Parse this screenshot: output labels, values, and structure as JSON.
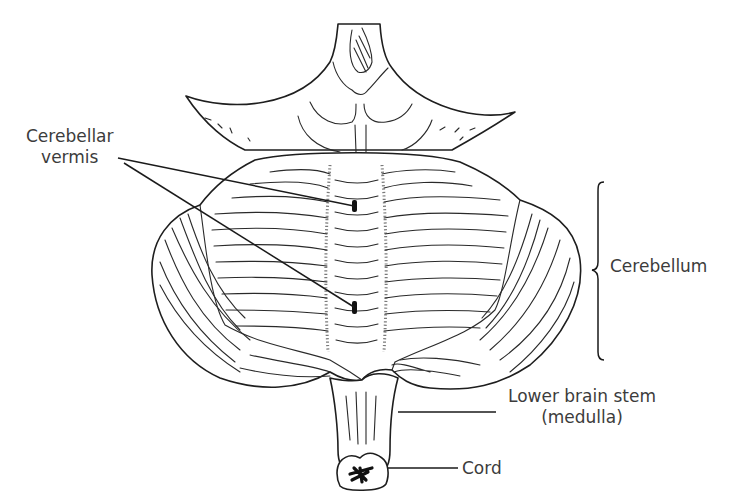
{
  "figure": {
    "colors": {
      "line": "#1e1e1e",
      "text": "#3c3c3c",
      "background": "#ffffff"
    }
  },
  "labels": {
    "vermis_line1": "Cerebellar",
    "vermis_line2": "vermis",
    "cerebellum": "Cerebellum",
    "medulla_line1": "Lower brain stem",
    "medulla_line2": "(medulla)",
    "cord": "Cord"
  }
}
